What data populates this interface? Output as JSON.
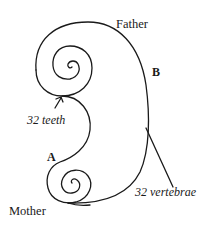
{
  "diagram": {
    "type": "spiral-curve-illustration",
    "labels": {
      "father": "Father",
      "mother": "Mother",
      "point_a": "A",
      "point_b": "B",
      "teeth": "32 teeth",
      "vertebrae": "32 vertebrae"
    },
    "colors": {
      "stroke": "#1a1a1a",
      "background": "#ffffff"
    }
  }
}
